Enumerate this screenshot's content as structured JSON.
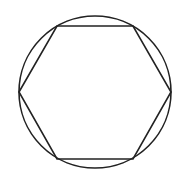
{
  "diagram": {
    "stroke_color": "#222222",
    "background": "#ffffff",
    "circle": {
      "cx": 95,
      "cy": 92,
      "r": 76
    },
    "hexagon": {
      "points": [
        [
          19,
          92
        ],
        [
          57,
          26
        ],
        [
          133,
          26
        ],
        [
          171,
          92
        ],
        [
          133,
          159
        ],
        [
          57,
          159
        ]
      ]
    }
  }
}
